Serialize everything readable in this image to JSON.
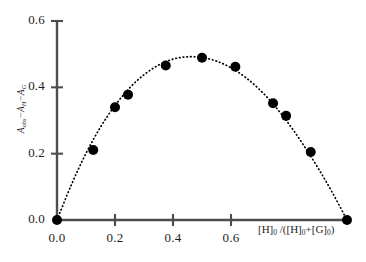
{
  "chart_data": {
    "type": "scatter",
    "title": "",
    "subtitle": "",
    "xlabel": "[H]0 /([H]0+[G]0)",
    "ylabel": "Aobs-AH-AG",
    "xlim": [
      0.0,
      1.0
    ],
    "ylim": [
      0.0,
      0.6
    ],
    "grid": false,
    "legend": null,
    "xticks": [
      {
        "value": 0.0,
        "label": "0.0"
      },
      {
        "value": 0.2,
        "label": "0.2"
      },
      {
        "value": 0.4,
        "label": "0.4"
      },
      {
        "value": 0.6,
        "label": "0.6"
      }
    ],
    "yticks": [
      {
        "value": 0.0,
        "label": "0.0"
      },
      {
        "value": 0.2,
        "label": "0.2"
      },
      {
        "value": 0.4,
        "label": "0.4"
      },
      {
        "value": 0.6,
        "label": "0.6"
      }
    ],
    "series": [
      {
        "name": "Job plot data",
        "marker": "filled-circle",
        "color": "#000000",
        "x": [
          0.0,
          0.125,
          0.2,
          0.245,
          0.375,
          0.5,
          0.615,
          0.745,
          0.79,
          0.875,
          1.0
        ],
        "y": [
          0.0,
          0.211,
          0.34,
          0.378,
          0.466,
          0.489,
          0.462,
          0.352,
          0.314,
          0.205,
          0.0
        ]
      },
      {
        "name": "fitted curve",
        "marker": "none",
        "linestyle": "dotted",
        "color": "#000000",
        "x": [
          0.0,
          0.05,
          0.1,
          0.15,
          0.2,
          0.25,
          0.3,
          0.35,
          0.4,
          0.45,
          0.5,
          0.55,
          0.6,
          0.65,
          0.7,
          0.75,
          0.8,
          0.85,
          0.9,
          0.95,
          1.0
        ],
        "y": [
          0.0,
          0.107,
          0.201,
          0.28,
          0.345,
          0.398,
          0.438,
          0.467,
          0.485,
          0.492,
          0.49,
          0.479,
          0.459,
          0.43,
          0.392,
          0.345,
          0.289,
          0.226,
          0.157,
          0.082,
          0.0
        ]
      }
    ],
    "axes_style": {
      "spine_color": "#4d4d4d",
      "tick_color": "#4d4d4d",
      "marker_color": "#000000",
      "curve_color": "#111111",
      "background": "#ffffff"
    }
  },
  "labels": {
    "ylabel_parts": {
      "a1": "A",
      "s1": "obs",
      "dash1": "−",
      "a2": "A",
      "s2": "H",
      "dash2": "−",
      "a3": "A",
      "s3": "G"
    },
    "xlabel_parts": {
      "p1": "[H]",
      "s1": "0",
      "p2": " /([H]",
      "s2": "0",
      "p3": "+[G]",
      "s3": "0",
      "p4": ")"
    }
  }
}
